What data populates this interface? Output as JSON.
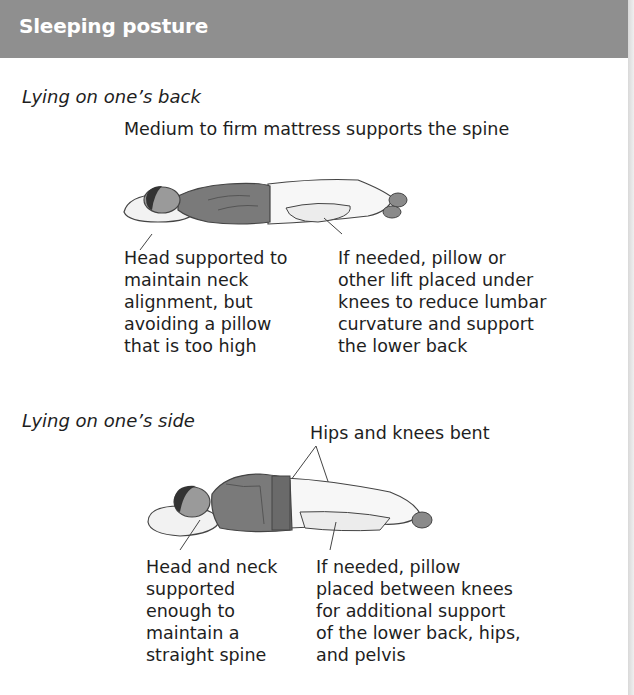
{
  "header": {
    "title": "Sleeping posture",
    "background": "#8f8f8f"
  },
  "sections": [
    {
      "label": "Lying on one’s back",
      "top_caption": "Medium to firm mattress supports the spine",
      "illustration": "person-lying-on-back-icon",
      "notes": [
        {
          "text": "Head supported to\nmaintain neck\nalignment, but\navoiding a pillow\nthat is too high"
        },
        {
          "text": "If needed, pillow or\nother lift placed under\nknees to reduce lumbar\ncurvature and support\nthe lower back"
        }
      ]
    },
    {
      "label": "Lying on one’s side",
      "top_caption": "Hips and knees bent",
      "illustration": "person-lying-on-side-icon",
      "notes": [
        {
          "text": "Head and neck\nsupported\nenough to\nmaintain a\nstraight spine"
        },
        {
          "text": "If needed, pillow\nplaced between knees\nfor additional support\nof the lower back, hips,\nand pelvis"
        }
      ]
    }
  ]
}
